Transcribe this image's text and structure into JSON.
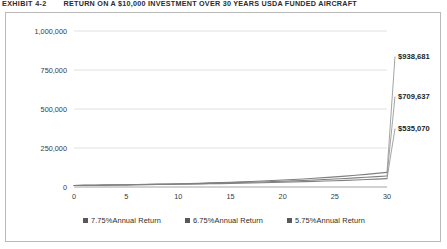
{
  "exhibit": {
    "label": "EXHIBIT 4-2",
    "title": "RETURN ON A $10,000 INVESTMENT OVER 30 YEARS USDA FUNDED AIRCRAFT"
  },
  "legend": {
    "position": "bottom-center",
    "items": [
      {
        "label": "7.75%Annual Return",
        "marker": "square",
        "color": "#595959"
      },
      {
        "label": "6.75%Annual Return",
        "marker": "square",
        "color": "#595959"
      },
      {
        "label": "5.75%Annual Return",
        "marker": "square",
        "color": "#595959"
      }
    ]
  },
  "axis": {
    "y_ticks": [
      "0",
      "250,000",
      "500,000",
      "750,000",
      "1,000,000"
    ],
    "x_ticks": [
      "0",
      "5",
      "10",
      "15",
      "20",
      "25",
      "30"
    ]
  },
  "end_labels": {
    "series_1": "$938,681",
    "series_2": "$709,637",
    "series_3": "$535,070"
  },
  "chart_data": {
    "type": "line",
    "title": "RETURN ON A $10,000 INVESTMENT OVER 30 YEARS USDA FUNDED AIRCRAFT",
    "xlabel": "",
    "ylabel": "",
    "xlim": [
      0,
      30
    ],
    "ylim": [
      0,
      1000000
    ],
    "yticks": [
      0,
      250000,
      500000,
      750000,
      1000000
    ],
    "ytick_labels": [
      "0",
      "250,000",
      "500,000",
      "750,000",
      "1,000,000"
    ],
    "xticks": [
      0,
      5,
      10,
      15,
      20,
      25,
      30
    ],
    "xtick_labels": [
      "0",
      "5",
      "10",
      "15",
      "20",
      "25",
      "30"
    ],
    "grid": "horizontal",
    "legend_position": "bottom-center",
    "x": [
      0,
      1,
      2,
      3,
      4,
      5,
      6,
      7,
      8,
      9,
      10,
      11,
      12,
      13,
      14,
      15,
      16,
      17,
      18,
      19,
      20,
      21,
      22,
      23,
      24,
      25,
      26,
      27,
      28,
      29,
      30
    ],
    "series": [
      {
        "name": "7.75%Annual Return",
        "rate": 0.0775,
        "principal": 10000,
        "color": "#808080",
        "end_label": "$938,681",
        "values": [
          10000,
          10775,
          11610,
          12510,
          13479,
          14524,
          15650,
          16863,
          18170,
          19578,
          21095,
          22730,
          24491,
          26389,
          28434,
          30638,
          33013,
          35571,
          38328,
          41299,
          44500,
          47949,
          51665,
          55669,
          59983,
          64632,
          69641,
          75039,
          80854,
          87120,
          93871
        ]
      },
      {
        "name": "6.75%Annual Return",
        "rate": 0.0675,
        "principal": 10000,
        "color": "#808080",
        "end_label": "$709,637",
        "values": [
          10000,
          10675,
          11396,
          12165,
          12986,
          13863,
          14799,
          15798,
          16864,
          18003,
          19218,
          20515,
          21900,
          23378,
          24956,
          26641,
          28439,
          30359,
          32408,
          34596,
          36931,
          39424,
          42085,
          44926,
          47958,
          51195,
          54651,
          58340,
          62278,
          66482,
          70971
        ]
      },
      {
        "name": "5.75%Annual Return",
        "rate": 0.0575,
        "principal": 10000,
        "color": "#808080",
        "end_label": "$535,070",
        "values": [
          10000,
          10575,
          11183,
          11826,
          12506,
          13225,
          13985,
          14789,
          15640,
          16539,
          17490,
          18496,
          19559,
          20684,
          21874,
          23131,
          24461,
          25868,
          27355,
          28928,
          30591,
          32350,
          34210,
          36177,
          38257,
          40457,
          42783,
          45243,
          47844,
          50595,
          53504
        ]
      }
    ],
    "note": "Values shown are cumulative value of a $10,000 investment compounded annually; end labels at year 30 are $938,681 / $709,637 / $535,070."
  }
}
